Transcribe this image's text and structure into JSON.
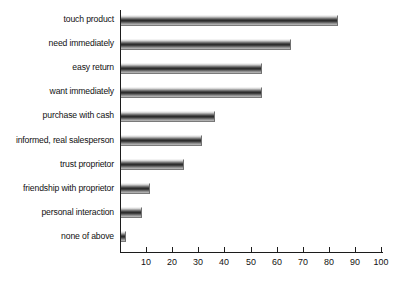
{
  "chart_data": {
    "type": "bar",
    "orientation": "horizontal",
    "title": "",
    "xlabel": "",
    "ylabel": "",
    "xlim": [
      0,
      100
    ],
    "grid": false,
    "legend": false,
    "categories": [
      "touch product",
      "need immediately",
      "easy return",
      "want immediately",
      "purchase with cash",
      "informed, real salesperson",
      "trust proprietor",
      "friendship with proprietor",
      "personal interaction",
      "none of above"
    ],
    "values": [
      83,
      65,
      54,
      54,
      36,
      31,
      24,
      11,
      8,
      2
    ],
    "xticks": [
      0,
      10,
      20,
      30,
      40,
      50,
      60,
      70,
      80,
      90,
      100
    ],
    "xticklabels": [
      "",
      "10",
      "20",
      "30",
      "40",
      "50",
      "60",
      "70",
      "80",
      "90",
      "100"
    ],
    "colors": {
      "axis": "#1c1c1c",
      "bar_dark": "#2d2d2d",
      "bar_light": "#e9e9e9",
      "text": "#111111",
      "background": "#ffffff"
    }
  }
}
